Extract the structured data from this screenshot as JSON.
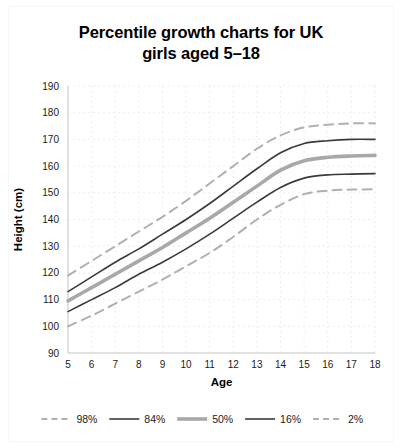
{
  "chart_data": {
    "type": "line",
    "title": "Percentile growth charts for UK\ngirls aged 5–18",
    "xlabel": "Age",
    "ylabel": "Height (cm)",
    "xlim": [
      5,
      18
    ],
    "ylim": [
      90,
      190
    ],
    "xticks": [
      5,
      6,
      7,
      8,
      9,
      10,
      11,
      12,
      13,
      14,
      15,
      16,
      17,
      18
    ],
    "yticks": [
      90,
      100,
      110,
      120,
      130,
      140,
      150,
      160,
      170,
      180,
      190
    ],
    "grid": true,
    "legend_position": "bottom",
    "x": [
      5,
      6,
      7,
      8,
      9,
      10,
      11,
      12,
      13,
      14,
      15,
      16,
      17,
      18
    ],
    "series": [
      {
        "name": "98%",
        "label": "98%",
        "color": "#b0b0b0",
        "style": "dashed",
        "width": 2.0,
        "values": [
          119.0,
          124.5,
          130.0,
          135.5,
          141.0,
          147.0,
          153.5,
          160.0,
          166.5,
          171.5,
          174.5,
          175.5,
          176.0,
          176.0
        ]
      },
      {
        "name": "84%",
        "label": "84%",
        "color": "#3a3a3a",
        "style": "solid",
        "width": 1.6,
        "values": [
          113.0,
          118.5,
          124.0,
          129.0,
          134.5,
          140.0,
          146.0,
          152.5,
          159.0,
          165.0,
          168.5,
          169.5,
          170.0,
          170.0
        ]
      },
      {
        "name": "50%",
        "label": "50%",
        "color": "#a8a8a8",
        "style": "solid",
        "width": 3.6,
        "values": [
          109.5,
          114.5,
          119.5,
          124.5,
          129.5,
          135.0,
          140.5,
          146.5,
          152.5,
          158.5,
          162.0,
          163.3,
          163.8,
          164.0
        ]
      },
      {
        "name": "16%",
        "label": "16%",
        "color": "#3a3a3a",
        "style": "solid",
        "width": 1.6,
        "values": [
          105.5,
          110.0,
          114.5,
          119.5,
          124.0,
          129.0,
          134.5,
          140.5,
          146.5,
          152.0,
          155.5,
          156.7,
          157.0,
          157.2
        ]
      },
      {
        "name": "2%",
        "label": "2%",
        "color": "#b0b0b0",
        "style": "dashed",
        "width": 2.0,
        "values": [
          100.0,
          104.0,
          108.5,
          113.0,
          117.5,
          122.5,
          127.5,
          133.5,
          140.0,
          145.5,
          149.5,
          150.8,
          151.2,
          151.3
        ]
      }
    ]
  }
}
